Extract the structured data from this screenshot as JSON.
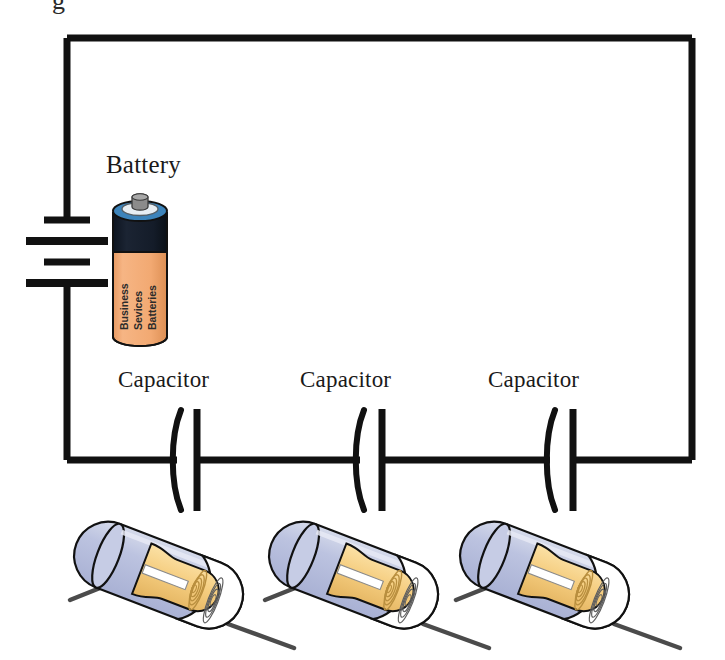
{
  "diagram": {
    "title_fragment": "g",
    "type": "series-capacitor-circuit-schematic",
    "battery": {
      "label": "Battery",
      "photo_label_lines": [
        "Business",
        "Sevices",
        "Batteries"
      ],
      "body_color": "#f3ad7a",
      "top_color": "#141b28",
      "rim_color": "#4a8fc0",
      "terminal_color": "#7d7d7d",
      "outline_color": "#111111"
    },
    "capacitors": [
      {
        "label": "Capacitor"
      },
      {
        "label": "Capacitor"
      },
      {
        "label": "Capacitor"
      }
    ],
    "capacitor_photo": {
      "case_color": "#b9c0de",
      "case_highlight": "#d3d8ea",
      "foil_color": "#f5cd7f",
      "foil_shade": "#e0b25c",
      "foil_light": "#fbe6b8",
      "lead_color": "#4b4b4b",
      "outline_color": "#111111",
      "cut_face_color": "#ffffff"
    },
    "wire": {
      "color": "#111111",
      "stroke_width": 7
    },
    "battery_symbol": {
      "plates": [
        {
          "kind": "short",
          "width": 46
        },
        {
          "kind": "long",
          "width": 82
        },
        {
          "kind": "short",
          "width": 46
        },
        {
          "kind": "long",
          "width": 82
        }
      ]
    }
  }
}
